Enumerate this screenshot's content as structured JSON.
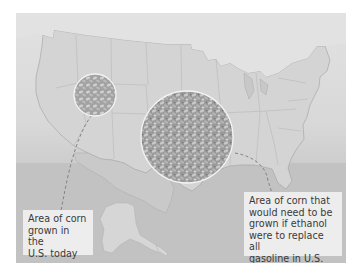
{
  "figure": {
    "colors": {
      "land": "#d3d3d3",
      "land_border": "#a9a9a9",
      "water": "#bdbdbd",
      "circle_stroke": "#f4f4f4",
      "dash": "#7a7a7a"
    },
    "circles": [
      {
        "id": "current",
        "description": "Area of corn grown in the U.S. today"
      },
      {
        "id": "ethanol",
        "description": "Area of corn needed to replace all gasoline with ethanol"
      }
    ]
  },
  "labels": {
    "left_lines": [
      "Area of corn",
      "grown in the",
      "U.S. today"
    ],
    "right_lines": [
      "Area of corn that",
      "would need to be",
      "grown if ethanol",
      "were to replace all",
      "gasoline in U.S."
    ]
  }
}
